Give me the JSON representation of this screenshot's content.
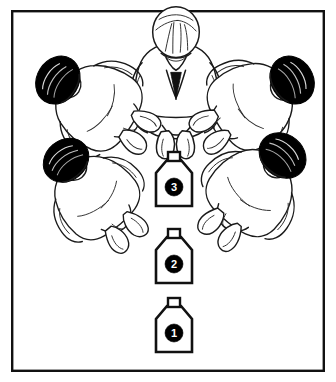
{
  "illustration": {
    "title": "Overhead view of five seated people around three numbered containers",
    "background_color": "#ffffff",
    "ink_color": "#111111",
    "hair_color": "#000000",
    "frame": {
      "name": "outer-border",
      "stroke_color": "#111111",
      "x": 11,
      "y": 10,
      "width": 314,
      "height": 362
    },
    "figures": [
      {
        "id": "figure-top-center",
        "label": "Top center figure",
        "hair": "light",
        "rotation_deg": 0,
        "cx": 176,
        "cy": 66
      },
      {
        "id": "figure-upper-left",
        "label": "Upper left figure",
        "hair": "dark",
        "rotation_deg": -58,
        "cx": 85,
        "cy": 97
      },
      {
        "id": "figure-upper-right",
        "label": "Upper right figure",
        "hair": "dark",
        "rotation_deg": 58,
        "cx": 265,
        "cy": 97
      },
      {
        "id": "figure-lower-left",
        "label": "Lower left figure",
        "hair": "dark",
        "rotation_deg": -40,
        "cx": 86,
        "cy": 184
      },
      {
        "id": "figure-lower-right",
        "label": "Lower right figure",
        "hair": "dark",
        "rotation_deg": 40,
        "cx": 262,
        "cy": 180
      }
    ],
    "containers": [
      {
        "id": "container-3",
        "number": "3",
        "cx": 174,
        "cy": 182,
        "order": 3
      },
      {
        "id": "container-2",
        "number": "2",
        "cx": 174,
        "cy": 259,
        "order": 2
      },
      {
        "id": "container-1",
        "number": "1",
        "cx": 174,
        "cy": 328,
        "order": 1
      }
    ]
  }
}
